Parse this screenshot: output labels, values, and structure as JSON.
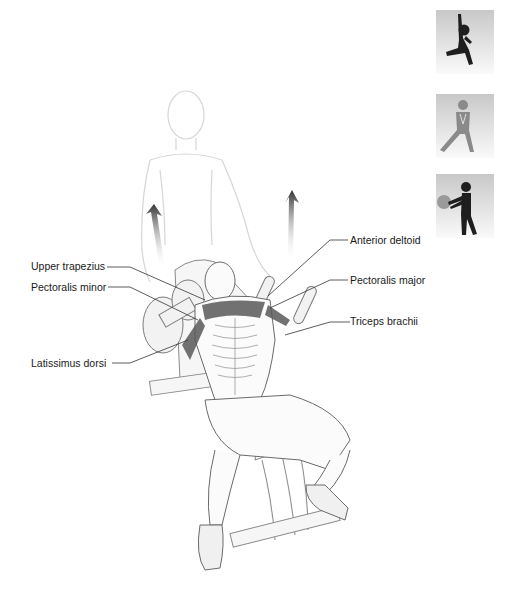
{
  "figure": {
    "labels_left": [
      {
        "id": "upper-trapezius",
        "text": "Upper trapezius"
      },
      {
        "id": "pectoralis-minor",
        "text": "Pectoralis minor"
      },
      {
        "id": "latissimus-dorsi",
        "text": "Latissimus dorsi"
      }
    ],
    "labels_right": [
      {
        "id": "anterior-deltoid",
        "text": "Anterior deltoid"
      },
      {
        "id": "pectoralis-major",
        "text": "Pectoralis major"
      },
      {
        "id": "triceps-brachii",
        "text": "Triceps brachii"
      }
    ],
    "category_icons": [
      {
        "name": "stretch-lunge-icon",
        "color": "#1e1e1e"
      },
      {
        "name": "side-lunge-icon",
        "color": "#8a8a8a"
      },
      {
        "name": "medicine-ball-icon",
        "color": "#1e1e1e"
      }
    ],
    "colors": {
      "line": "#333333",
      "muscle": "#5a5a5a",
      "arrow": "#3a3a3a",
      "spotter": "#d8d8d8"
    }
  }
}
